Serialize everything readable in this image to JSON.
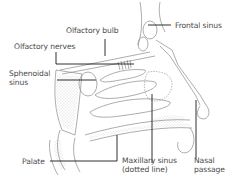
{
  "diagram": {
    "labels": {
      "olfactory_bulb": "Olfactory bulb",
      "olfactory_nerves": "Olfactory nerves",
      "frontal_sinus": "Frontal sinus",
      "sphenoidal_sinus_line1": "Sphenoidal",
      "sphenoidal_sinus_line2": "sinus",
      "palate": "Palate",
      "maxillary_sinus_line1": "Maxillary sinus",
      "maxillary_sinus_line2": "(dotted line)",
      "nasal_passage_line1": "Nasal",
      "nasal_passage_line2": "passage"
    },
    "colors": {
      "outline": "#8a8a8a",
      "leader_line": "#1a1a1a",
      "text": "#4a4a4a",
      "background": "#ffffff"
    }
  }
}
